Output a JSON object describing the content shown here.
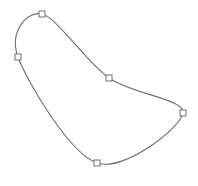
{
  "canvas": {
    "width": 198,
    "height": 186,
    "background": "#ffffff"
  },
  "curve": {
    "stroke": "#6e6e6e",
    "closed": true,
    "points": [
      {
        "id": "p1",
        "x": 42,
        "y": 14
      },
      {
        "id": "p2",
        "x": 109,
        "y": 78
      },
      {
        "id": "p3",
        "x": 183,
        "y": 113
      },
      {
        "id": "p4",
        "x": 97,
        "y": 163
      },
      {
        "id": "p5",
        "x": 18,
        "y": 57
      }
    ]
  },
  "handle": {
    "size": 6,
    "stroke": "#707070",
    "fill": "#ffffff"
  }
}
